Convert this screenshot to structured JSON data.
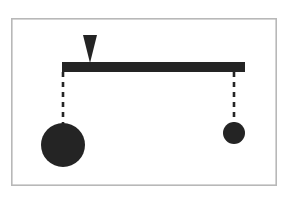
{
  "figure": {
    "title": "Lever balance with fulcrum and two hanging masses",
    "caption": "",
    "background_color": "#ffffff",
    "ink_color": "#242424",
    "frame_color": "#b8b8b8"
  },
  "frame": {
    "name": "figure-border",
    "x": 11,
    "y": 18,
    "width": 266,
    "height": 168,
    "stroke": "#b8b8b8",
    "stroke_width": 1.6,
    "fill": "#ffffff"
  },
  "beam": {
    "label": "horizontal beam",
    "x": 62,
    "y": 62,
    "width": 183,
    "height": 10,
    "color": "#242424"
  },
  "fulcrum": {
    "label": "fulcrum pointer",
    "shape": "triangle-down",
    "apex_x": 90,
    "apex_y": 63,
    "top_y": 35,
    "half_width": 7,
    "color": "#242424"
  },
  "strings": [
    {
      "name": "left-string",
      "label": "left string",
      "x": 63,
      "y_top": 72,
      "y_bottom": 124,
      "dash": "5 5",
      "stroke_width": 2.6,
      "color": "#242424"
    },
    {
      "name": "right-string",
      "label": "right string",
      "x": 234,
      "y_top": 72,
      "y_bottom": 123,
      "dash": "5 5",
      "stroke_width": 2.6,
      "color": "#242424"
    }
  ],
  "masses": [
    {
      "name": "left-mass",
      "label": "large mass",
      "side": "left",
      "cx": 63,
      "cy": 145,
      "r": 22,
      "color": "#242424",
      "relative_size": "large"
    },
    {
      "name": "right-mass",
      "label": "small mass",
      "side": "right",
      "cx": 234,
      "cy": 133,
      "r": 11,
      "color": "#242424",
      "relative_size": "small"
    }
  ],
  "chart_data": {
    "type": "diagram",
    "title": "Lever balance with fulcrum and two hanging masses",
    "elements": [
      {
        "id": "frame",
        "kind": "rectangle-outline",
        "x": 11,
        "y": 18,
        "w": 266,
        "h": 168
      },
      {
        "id": "beam",
        "kind": "rectangle-filled",
        "x": 62,
        "y": 62,
        "w": 183,
        "h": 10
      },
      {
        "id": "fulcrum",
        "kind": "triangle-down",
        "apex": [
          90,
          63
        ],
        "base_y": 35,
        "base_w": 14
      },
      {
        "id": "left-string",
        "kind": "dashed-line",
        "from": [
          63,
          72
        ],
        "to": [
          63,
          124
        ]
      },
      {
        "id": "right-string",
        "kind": "dashed-line",
        "from": [
          234,
          72
        ],
        "to": [
          234,
          123
        ]
      },
      {
        "id": "left-mass",
        "kind": "circle-filled",
        "c": [
          63,
          145
        ],
        "r": 22
      },
      {
        "id": "right-mass",
        "kind": "circle-filled",
        "c": [
          234,
          133
        ],
        "r": 11
      }
    ],
    "annotations": [],
    "legend": []
  }
}
